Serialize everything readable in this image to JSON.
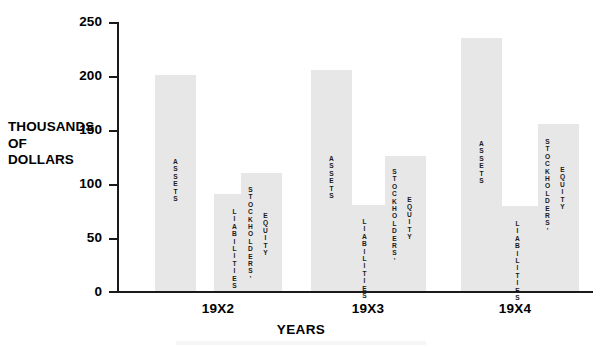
{
  "chart_data": {
    "type": "bar",
    "title": "",
    "subtitle": "",
    "xlabel": "YEARS",
    "ylabel": "THOUSANDS OF DOLLARS",
    "ylabel_lines": [
      "THOUSANDS",
      "OF",
      "DOLLARS"
    ],
    "categories": [
      "19X2",
      "19X3",
      "19X4"
    ],
    "ylim": [
      0,
      250
    ],
    "y_ticks": [
      0,
      50,
      100,
      150,
      200,
      250
    ],
    "y_tick_labels": [
      "0",
      "50",
      "100",
      "150",
      "200",
      "250"
    ],
    "grid": false,
    "legend": "none",
    "bar_color": "#e7e7e7",
    "axis_color": "#1a1a1a",
    "background": "#ffffff",
    "series": [
      {
        "name": "ASSETS",
        "values": [
          201,
          205,
          235
        ]
      },
      {
        "name": "LIABILITIES",
        "values": [
          90,
          80,
          79
        ]
      },
      {
        "name": "STOCKHOLDERS' EQUITY",
        "values": [
          110,
          126,
          155
        ]
      }
    ],
    "bar_captions": {
      "assets": "ASSETS",
      "liabilities": "LIABILITIES",
      "stockholders": "STOCKHOLDERS'",
      "equity": "EQUITY"
    }
  },
  "axis": {
    "y_title_line1": "THOUSANDS",
    "y_title_line2": "OF",
    "y_title_line3": "DOLLARS",
    "x_title": "YEARS",
    "tick_250": "250",
    "tick_200": "200",
    "tick_150": "150",
    "tick_100": "100",
    "tick_50": "50",
    "tick_0": "0"
  },
  "groups": {
    "g0_label": "19X2",
    "g1_label": "19X3",
    "g2_label": "19X4"
  },
  "captions": {
    "assets": "ASSETS",
    "liabilities": "LIABILITIES",
    "stockholders": "STOCKHOLDERS'",
    "equity": "EQUITY"
  }
}
